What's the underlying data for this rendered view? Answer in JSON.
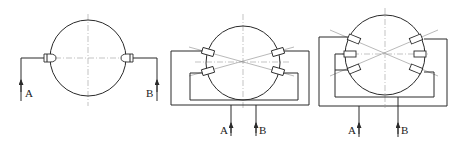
{
  "figure": {
    "type": "ultrasonic flowmeter transducer arrangement diagrams",
    "panels": [
      {
        "id": "single-path",
        "labels": {
          "a": "A",
          "b": "B"
        },
        "transducer_count": 2
      },
      {
        "id": "dual-path",
        "labels": {
          "a": "A",
          "b": "B"
        },
        "transducer_count": 4
      },
      {
        "id": "triple-path",
        "labels": {
          "a": "A",
          "b": "B"
        },
        "transducer_count": 6
      }
    ]
  },
  "colors": {
    "line": "#2a2a2a",
    "centerline": "#9a9a9a",
    "background": "#ffffff"
  }
}
